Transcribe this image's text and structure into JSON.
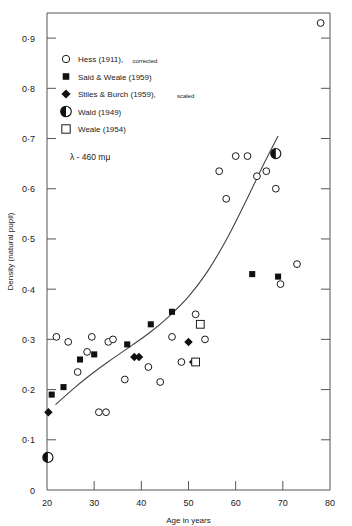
{
  "chart_data": {
    "type": "scatter",
    "title": "",
    "xlabel": "Age in years",
    "ylabel": "Density (natural pupil)",
    "annotation": "λ - 460 mμ",
    "xlim": [
      20,
      80
    ],
    "ylim": [
      0,
      0.95
    ],
    "grid": false,
    "legend_position": "upper-left",
    "xticks": [
      20,
      30,
      40,
      50,
      60,
      70,
      80
    ],
    "xticklabels": [
      "20",
      "30",
      "40",
      "50",
      "60",
      "70",
      "80"
    ],
    "yticks": [
      0,
      0.1,
      0.2,
      0.3,
      0.4,
      0.5,
      0.6,
      0.7,
      0.8,
      0.9
    ],
    "yticklabels": [
      "0",
      "0·1",
      "0·2",
      "0·3",
      "0·4",
      "0·5",
      "0·6",
      "0·7",
      "0·8",
      "0·9"
    ],
    "legend": [
      {
        "marker": "open-circle",
        "label": "Hess (1911),",
        "suffix": "corrected"
      },
      {
        "marker": "filled-square",
        "label": "Said & Weale (1959)",
        "suffix": ""
      },
      {
        "marker": "filled-diamond",
        "label": "Stiles & Burch (1959),",
        "suffix": "scaled"
      },
      {
        "marker": "half-circle",
        "label": "Wald (1949)",
        "suffix": ""
      },
      {
        "marker": "open-square",
        "label": "Weale (1954)",
        "suffix": ""
      }
    ],
    "series": [
      {
        "name": "Hess (1911), corrected",
        "marker": "open-circle",
        "points": [
          [
            22.0,
            0.305
          ],
          [
            24.5,
            0.295
          ],
          [
            26.5,
            0.235
          ],
          [
            28.5,
            0.275
          ],
          [
            29.5,
            0.305
          ],
          [
            31.0,
            0.155
          ],
          [
            32.5,
            0.155
          ],
          [
            33.0,
            0.295
          ],
          [
            34.0,
            0.3
          ],
          [
            36.5,
            0.22
          ],
          [
            41.5,
            0.245
          ],
          [
            44.0,
            0.215
          ],
          [
            46.5,
            0.305
          ],
          [
            48.5,
            0.255
          ],
          [
            51.5,
            0.35
          ],
          [
            53.5,
            0.3
          ],
          [
            56.5,
            0.635
          ],
          [
            58.0,
            0.58
          ],
          [
            60.0,
            0.665
          ],
          [
            62.5,
            0.665
          ],
          [
            64.5,
            0.625
          ],
          [
            66.5,
            0.635
          ],
          [
            68.5,
            0.6
          ],
          [
            69.5,
            0.41
          ],
          [
            73.0,
            0.45
          ],
          [
            78.0,
            0.93
          ]
        ]
      },
      {
        "name": "Said & Weale (1959)",
        "marker": "filled-square",
        "points": [
          [
            21.0,
            0.19
          ],
          [
            23.5,
            0.205
          ],
          [
            27.0,
            0.26
          ],
          [
            30.0,
            0.27
          ],
          [
            37.0,
            0.29
          ],
          [
            42.0,
            0.33
          ],
          [
            46.5,
            0.355
          ],
          [
            63.5,
            0.43
          ],
          [
            69.0,
            0.425
          ]
        ]
      },
      {
        "name": "Stiles & Burch (1959), scaled",
        "marker": "filled-diamond",
        "points": [
          [
            20.3,
            0.155
          ],
          [
            38.5,
            0.265
          ],
          [
            39.5,
            0.265
          ],
          [
            50.0,
            0.295
          ],
          [
            51.0,
            0.255
          ]
        ]
      },
      {
        "name": "Wald (1949)",
        "marker": "half-circle",
        "points": [
          [
            20.2,
            0.065
          ],
          [
            68.5,
            0.67
          ]
        ]
      },
      {
        "name": "Weale (1954)",
        "marker": "open-square",
        "points": [
          [
            52.5,
            0.33
          ],
          [
            51.5,
            0.255
          ]
        ]
      }
    ],
    "fitted_curve": {
      "name": "fitted-curve",
      "points": [
        [
          21.8,
          0.17
        ],
        [
          26.0,
          0.205
        ],
        [
          30.0,
          0.235
        ],
        [
          34.0,
          0.262
        ],
        [
          38.0,
          0.288
        ],
        [
          42.0,
          0.315
        ],
        [
          46.0,
          0.347
        ],
        [
          50.0,
          0.385
        ],
        [
          54.0,
          0.435
        ],
        [
          58.0,
          0.498
        ],
        [
          62.0,
          0.572
        ],
        [
          66.0,
          0.65
        ],
        [
          69.0,
          0.705
        ]
      ]
    }
  }
}
